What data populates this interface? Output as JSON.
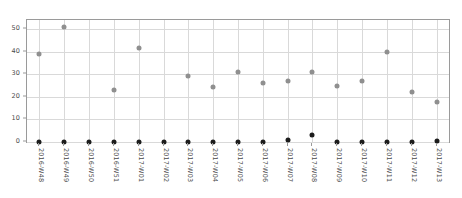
{
  "chart_data": {
    "type": "scatter",
    "title": "",
    "xlabel": "",
    "ylabel": "",
    "ylim": [
      0,
      54
    ],
    "yticks": [
      0,
      10,
      20,
      30,
      40,
      50
    ],
    "grid": true,
    "legend": "none",
    "categories": [
      "2016-W48",
      "2016-W49",
      "2016-W50",
      "2016-W51",
      "2017-W01",
      "2017-W02",
      "2017-W03",
      "2017-W04",
      "2017-W05",
      "2017-W06",
      "2017-W07",
      "2017-W08",
      "2017-W09",
      "2017-W10",
      "2017-W11",
      "2017-W12",
      "2017-W13"
    ],
    "series": [
      {
        "name": "upper-series",
        "color": "#8f8f8f",
        "values": [
          39,
          51,
          null,
          23,
          41.5,
          null,
          29,
          24.5,
          31,
          26,
          27,
          31,
          25,
          27,
          40,
          22,
          17.5
        ]
      },
      {
        "name": "lower-series",
        "color": "#1c1c1c",
        "values": [
          0,
          0,
          0,
          0,
          0,
          0,
          0,
          0,
          0,
          0,
          1,
          3,
          0,
          0,
          0,
          0,
          0.5
        ]
      }
    ]
  }
}
